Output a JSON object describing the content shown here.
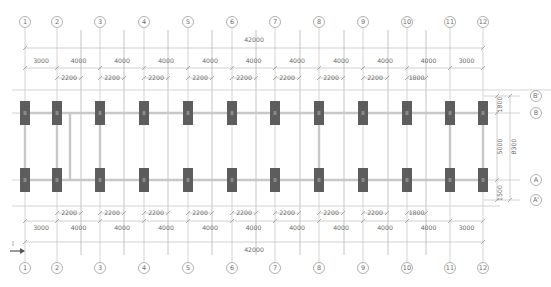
{
  "drawing": {
    "type": "structural foundation plan",
    "grid_axes_x": [
      {
        "label": "1",
        "x": 25
      },
      {
        "label": "2",
        "x": 57
      },
      {
        "label": "3",
        "x": 100
      },
      {
        "label": "4",
        "x": 144
      },
      {
        "label": "5",
        "x": 188
      },
      {
        "label": "6",
        "x": 232
      },
      {
        "label": "7",
        "x": 275
      },
      {
        "label": "8",
        "x": 319
      },
      {
        "label": "9",
        "x": 363
      },
      {
        "label": "10",
        "x": 407
      },
      {
        "label": "11",
        "x": 450
      },
      {
        "label": "12",
        "x": 483
      }
    ],
    "grid_axes_y": [
      {
        "label": "B'",
        "y": 96
      },
      {
        "label": "B",
        "y": 113
      },
      {
        "label": "A",
        "y": 180
      },
      {
        "label": "A'",
        "y": 200
      }
    ],
    "secondary_lines_x": [
      81,
      124,
      168,
      212,
      256,
      300,
      344,
      388,
      426
    ],
    "top_dimensions": {
      "overall": "42000",
      "segments": [
        "3000",
        "4000",
        "4000",
        "4000",
        "4000",
        "4000",
        "4000",
        "4000",
        "4000",
        "4000",
        "3000"
      ],
      "offsets": [
        "2200",
        "2200",
        "2200",
        "2200",
        "2200",
        "2200",
        "2200",
        "2200",
        "1800"
      ]
    },
    "bottom_dimensions": {
      "overall": "42000",
      "segments": [
        "3000",
        "4000",
        "4000",
        "4000",
        "4000",
        "4000",
        "4000",
        "4000",
        "4000",
        "4000",
        "3000"
      ],
      "offsets": [
        "2200",
        "2200",
        "2200",
        "2200",
        "2200",
        "2200",
        "2200",
        "2200",
        "1800"
      ]
    },
    "right_dimensions": {
      "top_offset": "1800",
      "bay": "5000",
      "bottom_offset": "1500",
      "overall": "8300"
    },
    "colors": {
      "column": "#5d5d5d",
      "beam": "#c8c8c8",
      "grid": "#c9c9c9",
      "text": "#6b6b6b"
    }
  }
}
